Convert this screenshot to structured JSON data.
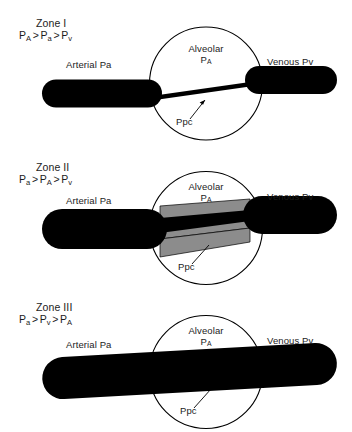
{
  "figure": {
    "background_color": "#ffffff",
    "vessel_color": "#000000",
    "capillary_gray": "#8c8c8c",
    "outline_color": "#000000"
  },
  "common_labels": {
    "arterial": "Arterial Pa",
    "venous": "Venous Pv",
    "alveolar_line1": "Alveolar",
    "alveolar_line2_base": "P",
    "alveolar_line2_sub": "A",
    "ppc": "Ppc"
  },
  "panels": [
    {
      "id": "zone-1",
      "zone_title": "Zone I",
      "equation": {
        "terms": [
          {
            "base": "P",
            "sub": "A"
          },
          {
            "base": "P",
            "sub": "a"
          },
          {
            "base": "P",
            "sub": "v"
          }
        ],
        "operator": ">",
        "text": "PA > Pa > Pv"
      },
      "arterial_label": "Arterial Pa",
      "venous_label": "Venous Pv",
      "alveolar_label": "Alveolar PA",
      "ppc_label": "Ppc",
      "capillary_state": "collapsed"
    },
    {
      "id": "zone-2",
      "zone_title": "Zone II",
      "equation": {
        "terms": [
          {
            "base": "P",
            "sub": "a"
          },
          {
            "base": "P",
            "sub": "A"
          },
          {
            "base": "P",
            "sub": "v"
          }
        ],
        "operator": ">",
        "text": "Pa > PA > Pv"
      },
      "arterial_label": "Arterial Pa",
      "venous_label": "Venous Pv",
      "alveolar_label": "Alveolar PA",
      "ppc_label": "Ppc",
      "capillary_state": "partially-compressed"
    },
    {
      "id": "zone-3",
      "zone_title": "Zone III",
      "equation": {
        "terms": [
          {
            "base": "P",
            "sub": "a"
          },
          {
            "base": "P",
            "sub": "v"
          },
          {
            "base": "P",
            "sub": "A"
          }
        ],
        "operator": ">",
        "text": "Pa > Pv > PA"
      },
      "arterial_label": "Arterial Pa",
      "venous_label": "Venous Pv",
      "alveolar_label": "Alveolar PA",
      "ppc_label": "Ppc",
      "capillary_state": "open"
    }
  ]
}
